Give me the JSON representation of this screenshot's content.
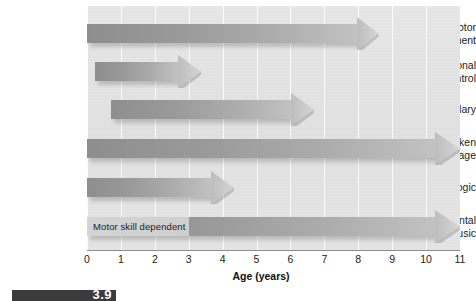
{
  "chart_data": {
    "type": "bar",
    "title": "",
    "subtitle": "",
    "xlabel": "Age (years)",
    "ylabel": "",
    "xlim": [
      0,
      11
    ],
    "xticks": [
      0,
      1,
      2,
      3,
      4,
      5,
      6,
      7,
      8,
      9,
      10,
      11
    ],
    "xtick_labels": [
      "0",
      "1",
      "2",
      "3",
      "4",
      "5",
      "6",
      "7",
      "8",
      "9",
      "10",
      "11"
    ],
    "grid": true,
    "grid_axis": "x",
    "legend": "none",
    "orientation": "horizontal",
    "note": "Sensitive-period ranges shown as horizontal arrows; arrowhead indicates the period continues/tapers",
    "categories": [
      "Motor development",
      "Emotional control",
      "Vocabulary",
      "Spoken language",
      "Math logic",
      "Instrumental music"
    ],
    "bars": [
      {
        "label": "Motor development",
        "label_lines": [
          "Motor",
          "development"
        ],
        "start": 0.0,
        "end": 8.0,
        "arrow_tip": 8.6,
        "annotation": ""
      },
      {
        "label": "Emotional control",
        "label_lines": [
          "Emotional",
          "control"
        ],
        "start": 0.25,
        "end": 2.7,
        "arrow_tip": 3.35,
        "annotation": ""
      },
      {
        "label": "Vocabulary",
        "label_lines": [
          "Vocabulary"
        ],
        "start": 0.7,
        "end": 6.05,
        "arrow_tip": 6.7,
        "annotation": ""
      },
      {
        "label": "Spoken language",
        "label_lines": [
          "Spoken",
          "language"
        ],
        "start": 0.0,
        "end": 10.3,
        "arrow_tip": 11.0,
        "annotation": ""
      },
      {
        "label": "Math logic",
        "label_lines": [
          "Math logic"
        ],
        "start": 0.0,
        "end": 3.7,
        "arrow_tip": 4.35,
        "annotation": ""
      },
      {
        "label": "Instrumental music",
        "label_lines": [
          "Instrumental",
          "music"
        ],
        "start": 0.0,
        "end": 10.3,
        "arrow_tip": 11.0,
        "annotation": "Motor skill dependent",
        "annotation_start": 0.0,
        "annotation_end": 3.0
      }
    ]
  },
  "axis": {
    "title": "Age (years)",
    "ticks": [
      "0",
      "1",
      "2",
      "3",
      "4",
      "5",
      "6",
      "7",
      "8",
      "9",
      "10",
      "11"
    ]
  },
  "caption": {
    "number": "3.9"
  },
  "colors": {
    "plot_background": "#e3e3e3",
    "bar_start": "#8e8e8e",
    "bar_end": "#c2c2c2",
    "annotation_band": "#d2d2d2",
    "gridline": "#fbfbfb",
    "axis_line": "#8d8d8d",
    "text": "#1b1b1b",
    "caption_strip": "#3b3b3b"
  }
}
